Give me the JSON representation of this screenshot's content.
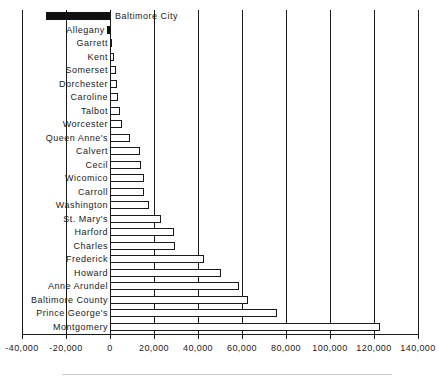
{
  "chart_data": {
    "type": "bar",
    "orientation": "horizontal",
    "title": "",
    "xlabel": "",
    "ylabel": "",
    "xlim": [
      -40000,
      140000
    ],
    "xticks": [
      -40000,
      -20000,
      0,
      20000,
      40000,
      60000,
      80000,
      100000,
      120000,
      140000
    ],
    "xtick_labels": [
      "-40,000",
      "-20,000",
      "0",
      "20,000",
      "40,000",
      "60,000",
      "80,000",
      "100,000",
      "120,000",
      "140,000"
    ],
    "grid": true,
    "grid_axis": "x",
    "legend": "none",
    "highlight_color": "#111111",
    "bar_color": "#ffffff",
    "bar_edge_color": "#1a1a1a",
    "categories": [
      "Baltimore City",
      "Allegany",
      "Garrett",
      "Kent",
      "Somerset",
      "Dorchester",
      "Caroline",
      "Talbot",
      "Worcester",
      "Queen Anne's",
      "Calvert",
      "Cecil",
      "Wicomico",
      "Carroll",
      "Washington",
      "St. Mary's",
      "Harford",
      "Charles",
      "Frederick",
      "Howard",
      "Anne Arundel",
      "Baltimore County",
      "Prince George's",
      "Montgomery"
    ],
    "values": [
      -29000,
      -1500,
      500,
      2000,
      2500,
      3000,
      3500,
      4500,
      5500,
      9000,
      13500,
      14000,
      15500,
      15500,
      17500,
      23000,
      29000,
      29500,
      42500,
      50500,
      58500,
      62500,
      76000,
      122500
    ],
    "highlighted_categories": [
      "Baltimore City",
      "Allegany"
    ],
    "label_inside_plot": [
      "Baltimore City"
    ]
  },
  "chart_meta": {
    "footer_rule": true
  }
}
